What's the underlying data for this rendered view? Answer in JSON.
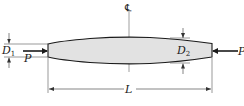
{
  "diagram": {
    "labels": {
      "centerline": "℄",
      "d1_main": "D",
      "d1_sub": "1",
      "d2_main": "D",
      "d2_sub": "2",
      "load_left": "P",
      "load_right": "P",
      "length": "L"
    },
    "colors": {
      "bar_fill": "#e2e2e2",
      "line": "#1a1a1a",
      "dim_line": "#555555"
    }
  }
}
